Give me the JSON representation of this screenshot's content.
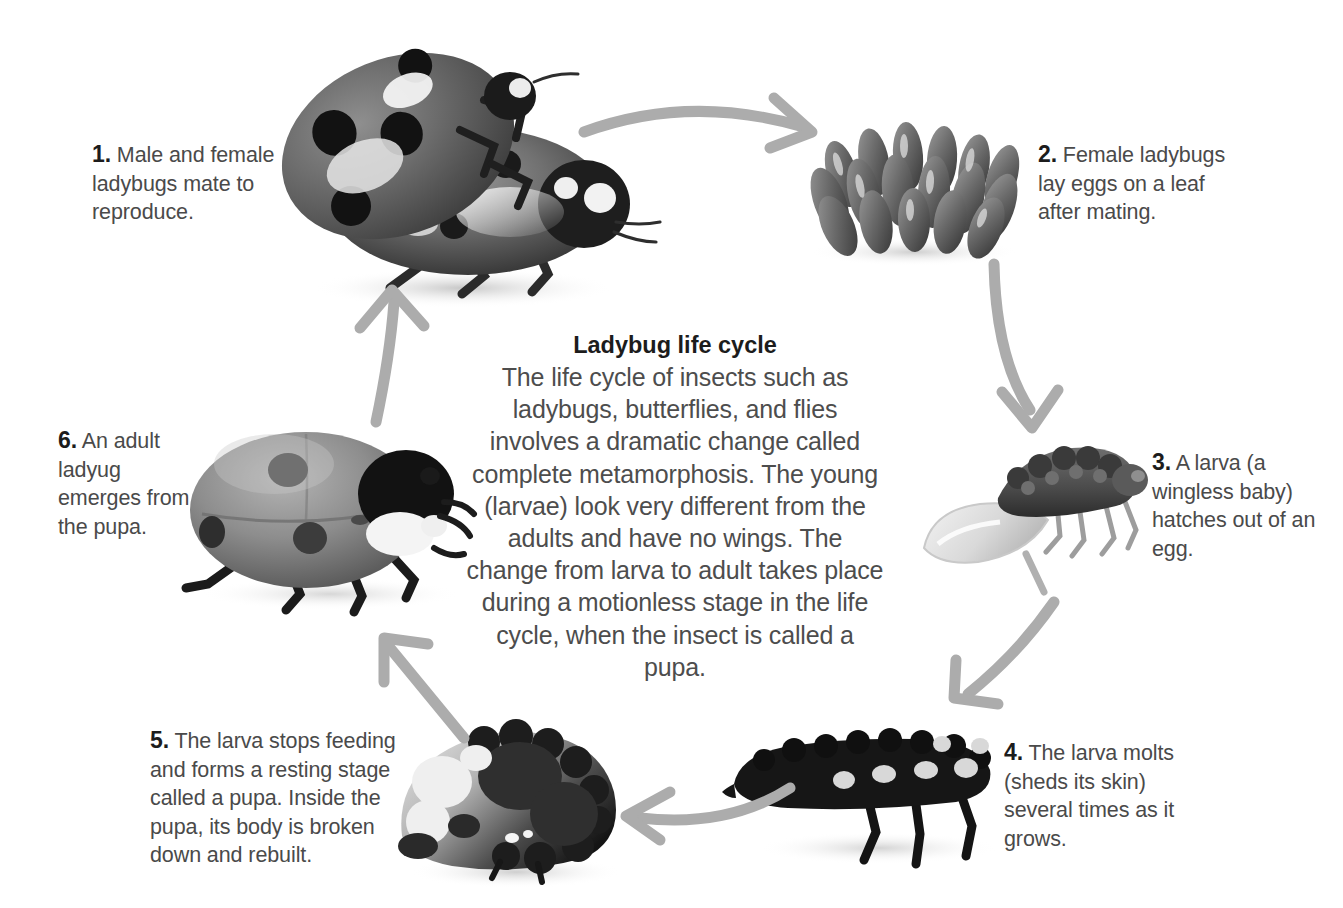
{
  "diagram": {
    "title": "Ladybug life cycle",
    "body": "The life cycle of insects such as ladybugs, butterflies, and flies involves a dramatic change called complete metamorphosis. The young (larvae) look very different from the adults and have no wings. The change from larva to adult takes place during a motionless stage in the life cycle, when the insect is called a pupa.",
    "background_color": "#ffffff",
    "arrow_color": "#a9a9a9",
    "text_color": "#4a4a4a",
    "heading_color": "#1c1c1c"
  },
  "steps": [
    {
      "number": "1.",
      "text": "Male and female ladybugs mate to reproduce.",
      "image_name": "mating-ladybugs-photo"
    },
    {
      "number": "2.",
      "text": "Female ladybugs lay eggs on a leaf after mating.",
      "image_name": "ladybug-eggs-photo"
    },
    {
      "number": "3.",
      "text": "A larva (a wingless baby) hatches out of an egg.",
      "image_name": "hatching-larva-photo"
    },
    {
      "number": "4.",
      "text": "The larva molts (sheds its skin) several times as it grows.",
      "image_name": "larva-photo"
    },
    {
      "number": "5.",
      "text": "The larva stops feeding and forms a resting stage called a pupa. Inside the pupa, its body is broken down and rebuilt.",
      "image_name": "pupa-photo"
    },
    {
      "number": "6.",
      "text": "An adult ladyug emerges from the pupa.",
      "image_name": "adult-ladybug-photo"
    }
  ],
  "arrows": [
    {
      "name": "arrow-step1-to-step2",
      "direction": "right"
    },
    {
      "name": "arrow-step2-to-step3",
      "direction": "down"
    },
    {
      "name": "arrow-step3-to-step4",
      "direction": "down-left"
    },
    {
      "name": "arrow-step4-to-step5",
      "direction": "left"
    },
    {
      "name": "arrow-step5-to-step6",
      "direction": "up-left"
    },
    {
      "name": "arrow-step6-to-step1",
      "direction": "up"
    }
  ]
}
